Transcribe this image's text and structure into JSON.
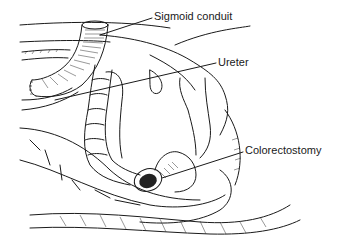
{
  "figure": {
    "labels": [
      {
        "id": "sigmoid-conduit",
        "text": "Sigmoid conduit"
      },
      {
        "id": "ureter",
        "text": "Ureter"
      },
      {
        "id": "colorectostomy",
        "text": "Colorectostomy"
      }
    ]
  }
}
